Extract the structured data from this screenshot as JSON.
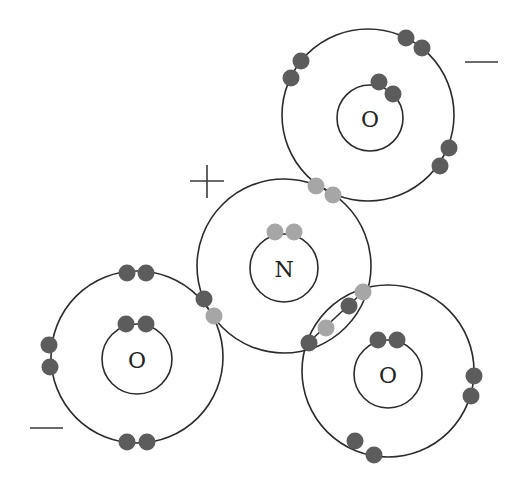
{
  "colors": {
    "nitrogen_electron": "#a6a6a6",
    "oxygen_electron": "#5c5c5c",
    "shell_stroke": "#2b2b2b",
    "background": "#ffffff"
  },
  "atoms": [
    {
      "id": "O-top",
      "label": "O",
      "cx": 368,
      "cy": 115,
      "outer_r": 86,
      "inner_cx": 370,
      "inner_cy": 118,
      "inner_r": 33
    },
    {
      "id": "N-center",
      "label": "N",
      "cx": 284,
      "cy": 266,
      "outer_r": 87,
      "inner_cx": 284,
      "inner_cy": 268,
      "inner_r": 34
    },
    {
      "id": "O-left",
      "label": "O",
      "cx": 137,
      "cy": 357,
      "outer_r": 86,
      "inner_cx": 137,
      "inner_cy": 359,
      "inner_r": 35
    },
    {
      "id": "O-right",
      "label": "O",
      "cx": 388,
      "cy": 371,
      "outer_r": 86,
      "inner_cx": 388,
      "inner_cy": 374,
      "inner_r": 34
    }
  ],
  "charges": [
    {
      "id": "charge-top-o",
      "symbol": "−",
      "x1": 465,
      "y1": 62,
      "x2": 498,
      "y2": 62
    },
    {
      "id": "charge-left-o",
      "symbol": "−",
      "x1": 30,
      "y1": 428,
      "x2": 63,
      "y2": 428
    },
    {
      "id": "charge-n",
      "symbol": "+",
      "cx": 207,
      "cy": 181
    }
  ],
  "bond_line": {
    "x1": 363,
    "y1": 292,
    "x2": 309,
    "y2": 342
  },
  "electrons": [
    {
      "atom": "O-top",
      "kind": "oxygen",
      "x": 406,
      "y": 38
    },
    {
      "atom": "O-top",
      "kind": "oxygen",
      "x": 422,
      "y": 48
    },
    {
      "atom": "O-top",
      "kind": "oxygen",
      "x": 301,
      "y": 61
    },
    {
      "atom": "O-top",
      "kind": "oxygen",
      "x": 291,
      "y": 78
    },
    {
      "atom": "O-top",
      "kind": "oxygen",
      "x": 379,
      "y": 82
    },
    {
      "atom": "O-top",
      "kind": "oxygen",
      "x": 393,
      "y": 94
    },
    {
      "atom": "O-top",
      "kind": "oxygen",
      "x": 449,
      "y": 148
    },
    {
      "atom": "O-top",
      "kind": "oxygen",
      "x": 440,
      "y": 166
    },
    {
      "atom": "N-center",
      "kind": "nitrogen",
      "x": 316,
      "y": 186
    },
    {
      "atom": "N-center",
      "kind": "nitrogen",
      "x": 333,
      "y": 195
    },
    {
      "atom": "N-center",
      "kind": "nitrogen",
      "x": 275,
      "y": 232
    },
    {
      "atom": "N-center",
      "kind": "nitrogen",
      "x": 294,
      "y": 232
    },
    {
      "atom": "O-left",
      "kind": "oxygen",
      "x": 204,
      "y": 299
    },
    {
      "atom": "N-center",
      "kind": "nitrogen",
      "x": 214,
      "y": 316
    },
    {
      "atom": "N-center",
      "kind": "nitrogen",
      "x": 363,
      "y": 292
    },
    {
      "atom": "O-right",
      "kind": "oxygen",
      "x": 349,
      "y": 306
    },
    {
      "atom": "N-center",
      "kind": "nitrogen",
      "x": 326,
      "y": 328
    },
    {
      "atom": "O-right",
      "kind": "oxygen",
      "x": 309,
      "y": 343
    },
    {
      "atom": "O-left",
      "kind": "oxygen",
      "x": 127,
      "y": 273
    },
    {
      "atom": "O-left",
      "kind": "oxygen",
      "x": 146,
      "y": 273
    },
    {
      "atom": "O-left",
      "kind": "oxygen",
      "x": 126,
      "y": 324
    },
    {
      "atom": "O-left",
      "kind": "oxygen",
      "x": 146,
      "y": 324
    },
    {
      "atom": "O-left",
      "kind": "oxygen",
      "x": 49,
      "y": 345
    },
    {
      "atom": "O-left",
      "kind": "oxygen",
      "x": 50,
      "y": 367
    },
    {
      "atom": "O-left",
      "kind": "oxygen",
      "x": 127,
      "y": 442
    },
    {
      "atom": "O-left",
      "kind": "oxygen",
      "x": 147,
      "y": 442
    },
    {
      "atom": "O-right",
      "kind": "oxygen",
      "x": 378,
      "y": 340
    },
    {
      "atom": "O-right",
      "kind": "oxygen",
      "x": 397,
      "y": 340
    },
    {
      "atom": "O-right",
      "kind": "oxygen",
      "x": 474,
      "y": 376
    },
    {
      "atom": "O-right",
      "kind": "oxygen",
      "x": 471,
      "y": 396
    },
    {
      "atom": "O-right",
      "kind": "oxygen",
      "x": 355,
      "y": 441
    },
    {
      "atom": "O-right",
      "kind": "oxygen",
      "x": 374,
      "y": 455
    }
  ],
  "electron_radius": 8.5
}
